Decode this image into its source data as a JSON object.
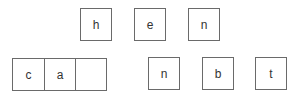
{
  "source_tiles": [
    {
      "letter": "h"
    },
    {
      "letter": "e"
    },
    {
      "letter": "n"
    }
  ],
  "answer_slots": [
    {
      "letter": "c"
    },
    {
      "letter": "a"
    },
    {
      "letter": ""
    }
  ],
  "choice_tiles": [
    {
      "letter": "n"
    },
    {
      "letter": "b"
    },
    {
      "letter": "t"
    }
  ]
}
